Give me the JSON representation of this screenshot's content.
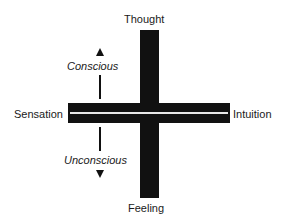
{
  "diagram": {
    "type": "cross",
    "axes": {
      "vertical": {
        "top": "Thought",
        "bottom": "Feeling"
      },
      "horizontal": {
        "left": "Sensation",
        "right": "Intuition"
      }
    },
    "annotations": {
      "upper": "Conscious",
      "lower": "Unconscious"
    },
    "colors": {
      "bars": "#111111",
      "divider": "#e8e8e8",
      "text": "#1a1a1a",
      "background": "#ffffff"
    }
  }
}
